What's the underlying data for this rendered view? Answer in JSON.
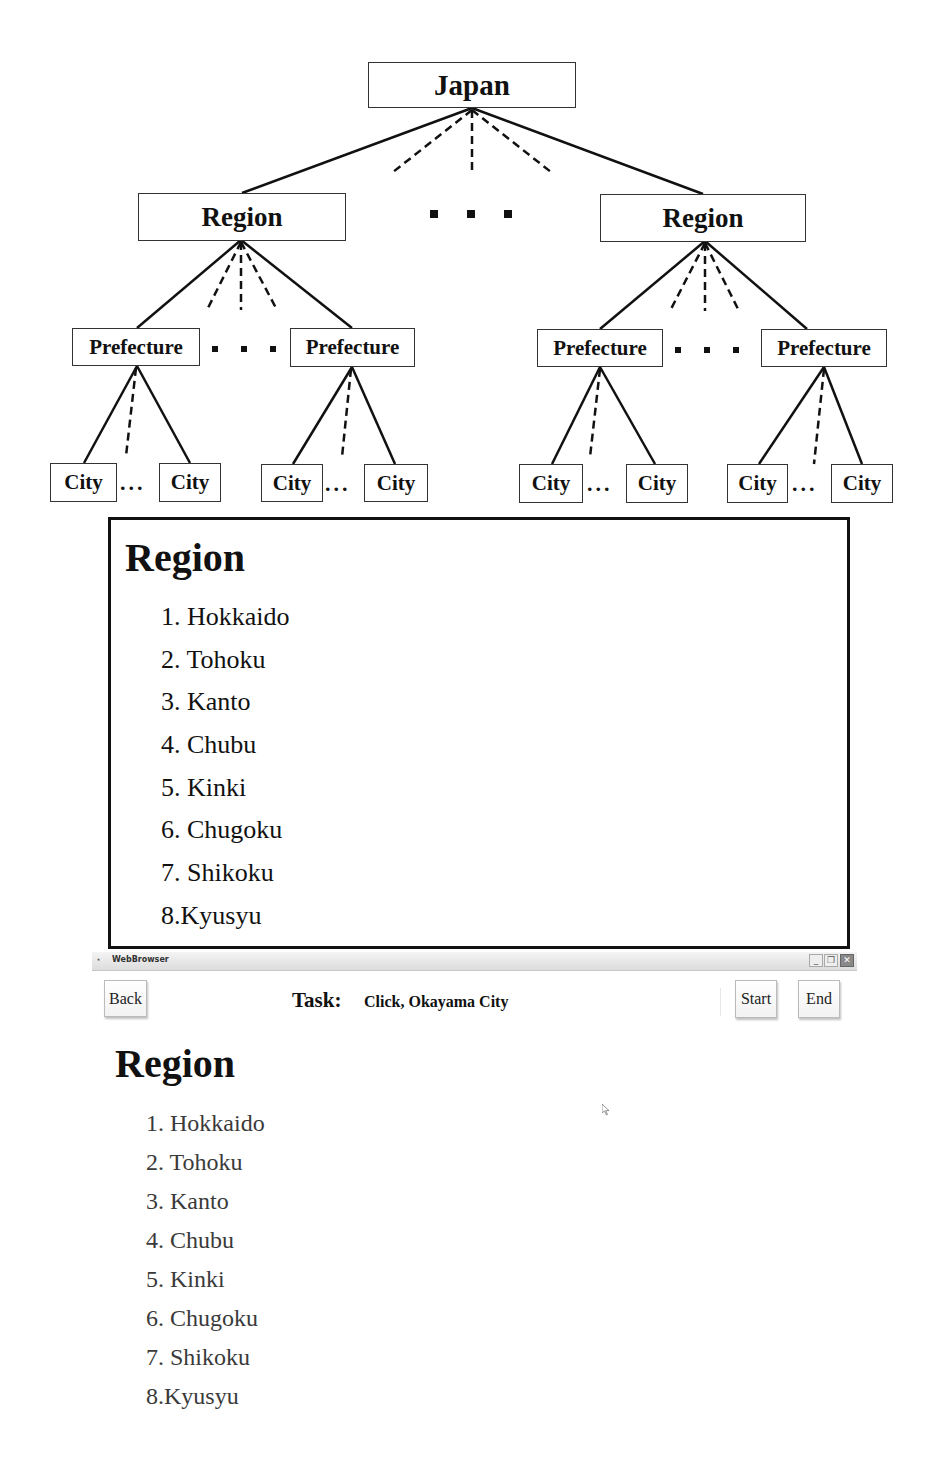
{
  "diagram": {
    "root": "Japan",
    "level1": [
      "Region",
      "Region"
    ],
    "level2": [
      "Prefecture",
      "Prefecture",
      "Prefecture",
      "Prefecture"
    ],
    "level3": [
      "City",
      "City",
      "City",
      "City",
      "City",
      "City",
      "City",
      "City"
    ],
    "ellipsis": "..."
  },
  "panel": {
    "heading": "Region",
    "items": [
      "1. Hokkaido",
      "2. Tohoku",
      "3. Kanto",
      "4. Chubu",
      "5. Kinki",
      "6. Chugoku",
      "7. Shikoku",
      "8.Kyusyu"
    ]
  },
  "window": {
    "title": "WebBrowser",
    "minimize": "_",
    "restore": "❐",
    "close": "✕"
  },
  "toolbar": {
    "back_label": "Back",
    "task_label": "Task:",
    "task_text": "Click, Okayama City",
    "start_label": "Start",
    "end_label": "End"
  },
  "page": {
    "heading": "Region",
    "items": [
      "1. Hokkaido",
      "2. Tohoku",
      "3. Kanto",
      "4. Chubu",
      "5. Kinki",
      "6. Chugoku",
      "7. Shikoku",
      "8.Kyusyu"
    ]
  },
  "colors": {
    "text": "#111111",
    "list_text_browser": "#3a3a3a",
    "border": "#333333",
    "background": "#ffffff"
  }
}
